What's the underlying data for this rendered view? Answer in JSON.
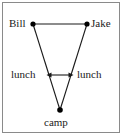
{
  "figure": {
    "width": 124,
    "height": 137,
    "background_color": "#ffffff",
    "border_color": "#8a8a8a",
    "line_color": "#1a1a1a",
    "node_color": "#000000"
  },
  "nodes": [
    {
      "id": "bill",
      "label": "Bill",
      "x": 33,
      "y": 24
    },
    {
      "id": "jake",
      "label": "Jake",
      "x": 87,
      "y": 24
    },
    {
      "id": "camp",
      "label": "camp",
      "x": 60,
      "y": 110
    }
  ],
  "edge_labels": [
    {
      "id": "lunch-left",
      "label": "lunch"
    },
    {
      "id": "lunch-right",
      "label": "lunch"
    }
  ],
  "arrow": {
    "type": "double-headed",
    "x1": 47,
    "x2": 73,
    "y": 75
  }
}
